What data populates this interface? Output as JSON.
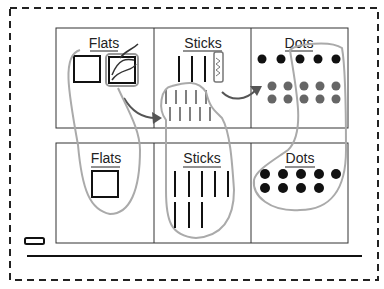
{
  "diagram": {
    "title": "",
    "top_row": {
      "headers": [
        "Flats",
        "Sticks",
        "Dots"
      ],
      "flats_count": 2,
      "sticks_count": 3,
      "regrouped_sticks_count": 10,
      "dots_count": 5,
      "regrouped_dots_count": 10
    },
    "bottom_row": {
      "headers": [
        "Flats",
        "Sticks",
        "Dots"
      ],
      "flats_count": 1,
      "sticks_count": 8,
      "dots_count": 9
    },
    "colors": {
      "ink": "#111111",
      "grid": "#333333",
      "loop": "#aaaaaa",
      "arrow": "#555555",
      "grey_dot": "#666666"
    }
  }
}
